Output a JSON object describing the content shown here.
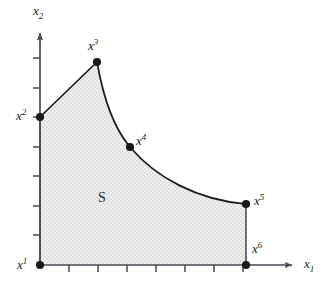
{
  "figure": {
    "type": "math-region-diagram",
    "title": "",
    "background_color": "#ffffff",
    "region": {
      "label": "S",
      "fill_color": "#e9e9e9",
      "stipple": true,
      "boundary_color": "#1a1a1a"
    },
    "axes": {
      "x_axis": {
        "label": "x",
        "subscript": "1",
        "color": "#4a4a55",
        "origin_px": [
          40,
          265
        ],
        "end_px": [
          299,
          265
        ],
        "arrow": true,
        "tick_count": 7,
        "tick_spacing_px": 29
      },
      "y_axis": {
        "label": "x",
        "subscript": "2",
        "color": "#4a4a55",
        "origin_px": [
          40,
          265
        ],
        "end_px": [
          40,
          26
        ],
        "arrow": true,
        "tick_count": 7,
        "tick_spacing_px": 29.5
      }
    },
    "points": [
      {
        "name": "x1",
        "base": "x",
        "superscript": "1",
        "px": [
          40,
          265
        ],
        "label_px": [
          17,
          257
        ],
        "marker": "filled-circle"
      },
      {
        "name": "x2",
        "base": "x",
        "superscript": "2",
        "px": [
          40,
          117
        ],
        "label_px": [
          16,
          108
        ],
        "marker": "filled-circle"
      },
      {
        "name": "x3",
        "base": "x",
        "superscript": "3",
        "px": [
          97,
          62
        ],
        "label_px": [
          88,
          38
        ],
        "marker": "filled-circle"
      },
      {
        "name": "x4",
        "base": "x",
        "superscript": "4",
        "px": [
          130,
          147
        ],
        "label_px": [
          136,
          133
        ],
        "marker": "filled-circle"
      },
      {
        "name": "x5",
        "base": "x",
        "superscript": "5",
        "px": [
          246,
          204
        ],
        "label_px": [
          254,
          193
        ],
        "marker": "filled-circle"
      },
      {
        "name": "x6",
        "base": "x",
        "superscript": "6",
        "px": [
          246,
          265
        ],
        "label_px": [
          252,
          241
        ],
        "marker": "filled-circle"
      }
    ],
    "edges": [
      {
        "from": "x1",
        "to": "x2",
        "kind": "straight",
        "note": "vertical left edge along x2-axis"
      },
      {
        "from": "x2",
        "to": "x3",
        "kind": "straight",
        "note": "rising straight segment"
      },
      {
        "from": "x3",
        "to": "x4",
        "kind": "curve",
        "note": "steep convex decreasing arc"
      },
      {
        "from": "x4",
        "to": "x5",
        "kind": "curve",
        "note": "shallow convex decreasing arc"
      },
      {
        "from": "x5",
        "to": "x6",
        "kind": "straight",
        "note": "vertical right edge"
      },
      {
        "from": "x6",
        "to": "x1",
        "kind": "straight",
        "note": "bottom edge along x1-axis"
      }
    ],
    "region_label_px": [
      98,
      191
    ]
  }
}
